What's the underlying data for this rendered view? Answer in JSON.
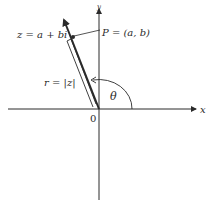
{
  "figure": {
    "axes": {
      "x_label": "x",
      "y_label": "y",
      "origin_label": "0"
    },
    "vector": {
      "z_label": "z = a + bi",
      "point_label": "P = (a, b)",
      "modulus_label": "r = |z|",
      "angle_label": "θ"
    },
    "colors": {
      "ink": "#2a2a2a",
      "background": "#ffffff"
    }
  }
}
